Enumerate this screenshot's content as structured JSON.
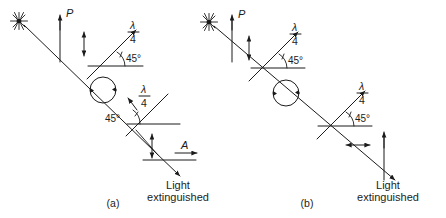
{
  "figure": {
    "background_color": "#ffffff",
    "ink_color": "#1b1b1b",
    "width": 446,
    "height": 218
  },
  "panels": [
    {
      "id": "a",
      "caption": "(a)",
      "source_label": "source-star",
      "polarizer_label": "P",
      "first_waveplate": {
        "numerator": "λ",
        "denominator": "4",
        "angle_label": "45°",
        "orientation": "up-right"
      },
      "circular_polarization_label": "circular",
      "second_waveplate": {
        "numerator": "λ",
        "denominator": "4",
        "angle_label": "45°",
        "orientation": "up-right-opposed"
      },
      "analyzer_label": "A",
      "result_line_1": "Light",
      "result_line_2": "extinguished"
    },
    {
      "id": "b",
      "caption": "(b)",
      "source_label": "source-star",
      "polarizer_label": "P",
      "first_waveplate": {
        "numerator": "λ",
        "denominator": "4",
        "angle_label": "45°",
        "orientation": "up-right"
      },
      "circular_polarization_label": "circular",
      "second_waveplate": {
        "numerator": "λ",
        "denominator": "4",
        "angle_label": "45°",
        "orientation": "up-right"
      },
      "analyzer_label": "",
      "result_line_1": "Light",
      "result_line_2": "extinguished"
    }
  ]
}
